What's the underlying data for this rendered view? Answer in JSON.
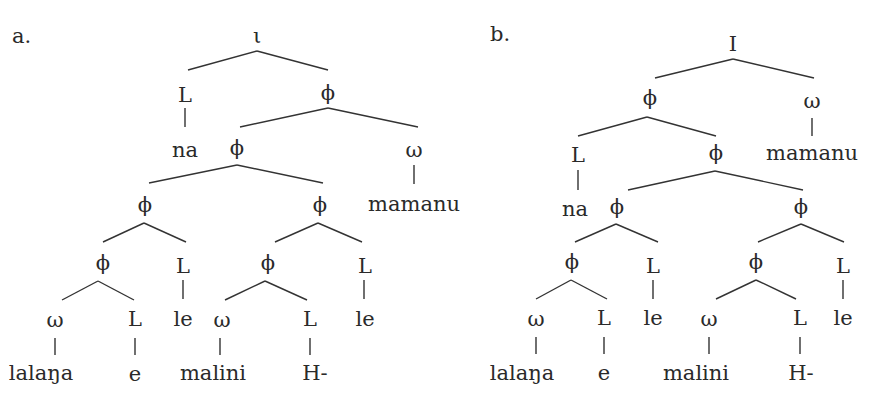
{
  "panels": {
    "a": {
      "label": "a.",
      "root": "ι",
      "nodes": {
        "L1": "L",
        "phi1": "ϕ",
        "na": "na",
        "phi2": "ϕ",
        "omega1": "ω",
        "mamanu": "mamanu",
        "phi3": "ϕ",
        "phi4": "ϕ",
        "phi5": "ϕ",
        "L2": "L",
        "le1": "le",
        "phi6": "ϕ",
        "L3": "L",
        "le2": "le",
        "omega2": "ω",
        "L4": "L",
        "lalana": "lalaŋa",
        "e": "e",
        "omega3": "ω",
        "L5": "L",
        "malini": "malini",
        "H": "H-"
      }
    },
    "b": {
      "label": "b.",
      "root": "I",
      "nodes": {
        "phi1": "ϕ",
        "omega1": "ω",
        "mamanu": "mamanu",
        "L1": "L",
        "phi2": "ϕ",
        "na": "na",
        "phi3": "ϕ",
        "phi4": "ϕ",
        "phi5": "ϕ",
        "L2": "L",
        "le1": "le",
        "phi6": "ϕ",
        "L3": "L",
        "le2": "le",
        "omega2": "ω",
        "L4": "L",
        "lalana": "lalaŋa",
        "e": "e",
        "omega3": "ω",
        "L5": "L",
        "malini": "malini",
        "H": "H-"
      }
    }
  },
  "colors": {
    "ink": "#2a2a2a",
    "background": "#ffffff"
  }
}
